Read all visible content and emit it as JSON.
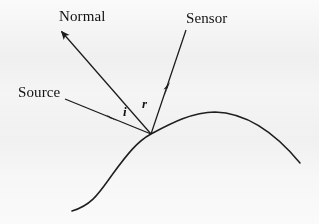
{
  "diagram": {
    "background_color": "#fafafa",
    "ink_color": "#1a1a1a",
    "labels": {
      "normal": "Normal",
      "sensor": "Sensor",
      "source": "Source",
      "angle_incidence": "i",
      "angle_reflection": "r"
    },
    "geometry": {
      "surface_point": {
        "x": 151,
        "y": 134
      },
      "surface_curve": "M 72 211 C 92 205 99 193 112 175 C 128 153 138 141 151 134 C 170 124 192 112 215 112 C 248 113 276 134 300 163",
      "normal_ray": {
        "from": {
          "x": 151,
          "y": 134
        },
        "to": {
          "x": 58,
          "y": 28
        },
        "arrow_at": "tip"
      },
      "sensor_ray": {
        "from": {
          "x": 151,
          "y": 134
        },
        "to": {
          "x": 186,
          "y": 30
        },
        "arrow_at": "mid",
        "arrow_point": {
          "x": 166,
          "y": 89
        }
      },
      "source_ray": {
        "from": {
          "x": 65,
          "y": 99
        },
        "to": {
          "x": 151,
          "y": 134
        },
        "arrow_at": "mid",
        "arrow_point": {
          "x": 110,
          "y": 118
        }
      }
    }
  }
}
